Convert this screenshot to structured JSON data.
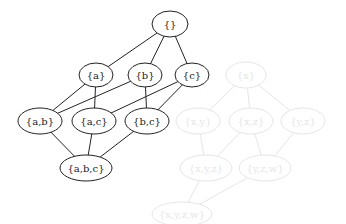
{
  "diagram": {
    "type": "hasse-lattice",
    "nodes": [
      {
        "id": "empty",
        "label": "{}",
        "x": 170,
        "y": 24,
        "rx": 18,
        "ry": 13
      },
      {
        "id": "a",
        "label": "{a}",
        "x": 96,
        "y": 75,
        "rx": 17,
        "ry": 12
      },
      {
        "id": "b",
        "label": "{b}",
        "x": 145,
        "y": 75,
        "rx": 17,
        "ry": 12
      },
      {
        "id": "c",
        "label": "{c}",
        "x": 192,
        "y": 75,
        "rx": 17,
        "ry": 12
      },
      {
        "id": "ab",
        "label": "{a,b}",
        "x": 40,
        "y": 121,
        "rx": 22,
        "ry": 13
      },
      {
        "id": "ac",
        "label": "{a,c}",
        "x": 94,
        "y": 121,
        "rx": 22,
        "ry": 13
      },
      {
        "id": "bc",
        "label": "{b,c}",
        "x": 147,
        "y": 121,
        "rx": 22,
        "ry": 13
      },
      {
        "id": "abc",
        "label": "{a,b,c}",
        "x": 86,
        "y": 168,
        "rx": 26,
        "ry": 13
      }
    ],
    "edges": [
      [
        "empty",
        "a"
      ],
      [
        "empty",
        "b"
      ],
      [
        "empty",
        "c"
      ],
      [
        "a",
        "ab"
      ],
      [
        "a",
        "ac"
      ],
      [
        "b",
        "ab"
      ],
      [
        "b",
        "bc"
      ],
      [
        "c",
        "ac"
      ],
      [
        "c",
        "bc"
      ],
      [
        "ab",
        "abc"
      ],
      [
        "ac",
        "abc"
      ],
      [
        "bc",
        "abc"
      ]
    ],
    "ghost_nodes": [
      {
        "id": "g0",
        "label": "{x}",
        "x": 246,
        "y": 75,
        "rx": 20,
        "ry": 13
      },
      {
        "id": "g1",
        "label": "{x,y}",
        "x": 198,
        "y": 121,
        "rx": 22,
        "ry": 13
      },
      {
        "id": "g2",
        "label": "{x,z}",
        "x": 251,
        "y": 121,
        "rx": 22,
        "ry": 13
      },
      {
        "id": "g3",
        "label": "{y,z}",
        "x": 303,
        "y": 121,
        "rx": 22,
        "ry": 13
      },
      {
        "id": "g4",
        "label": "{x,y,z}",
        "x": 206,
        "y": 168,
        "rx": 26,
        "ry": 13
      },
      {
        "id": "g5",
        "label": "{y,z,w}",
        "x": 265,
        "y": 168,
        "rx": 26,
        "ry": 13
      },
      {
        "id": "g6",
        "label": "{x,y,z,w}",
        "x": 182,
        "y": 214,
        "rx": 30,
        "ry": 12
      }
    ],
    "ghost_edges": [
      [
        "g0",
        "g1"
      ],
      [
        "g0",
        "g2"
      ],
      [
        "g0",
        "g3"
      ],
      [
        "g1",
        "g4"
      ],
      [
        "g2",
        "g4"
      ],
      [
        "g2",
        "g5"
      ],
      [
        "g3",
        "g5"
      ],
      [
        "g4",
        "g6"
      ],
      [
        "g5",
        "g6"
      ]
    ]
  }
}
